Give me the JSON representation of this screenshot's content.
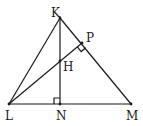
{
  "diagram": {
    "type": "geometry-triangle",
    "points": {
      "K": {
        "label": "K",
        "x": 60,
        "y": 18,
        "lx": 51,
        "ly": 17
      },
      "P": {
        "label": "P",
        "x": 82,
        "y": 43,
        "lx": 86,
        "ly": 42
      },
      "H": {
        "label": "H",
        "x": 60,
        "y": 61,
        "lx": 63,
        "ly": 71
      },
      "L": {
        "label": "L",
        "x": 9,
        "y": 104,
        "lx": 5,
        "ly": 120
      },
      "N": {
        "label": "N",
        "x": 60,
        "y": 104,
        "lx": 56,
        "ly": 120
      },
      "M": {
        "label": "M",
        "x": 131,
        "y": 104,
        "lx": 126,
        "ly": 120
      }
    },
    "segments": [
      [
        "K",
        "L"
      ],
      [
        "K",
        "M"
      ],
      [
        "L",
        "M"
      ],
      [
        "K",
        "N"
      ],
      [
        "L",
        "P"
      ]
    ],
    "right_angles": [
      {
        "at": "N",
        "description": "KN perpendicular to LM"
      },
      {
        "at": "P",
        "description": "LP perpendicular to KM"
      }
    ],
    "stroke_color": "#1a1a1a",
    "background": "#ffffff"
  }
}
